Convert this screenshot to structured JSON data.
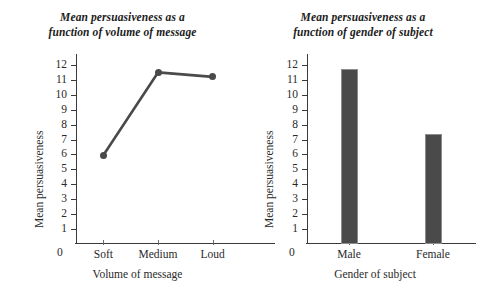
{
  "chart_data": [
    {
      "type": "line",
      "panel": "left",
      "title": "Mean persuasiveness as a function of volume of message",
      "title_lines": [
        "Mean persuasiveness as a",
        "function of volume of message"
      ],
      "xlabel": "Volume of message",
      "ylabel": "Mean persuasiveness",
      "categories": [
        "Soft",
        "Medium",
        "Loud"
      ],
      "values": [
        5.95,
        11.5,
        11.2
      ],
      "ylim": [
        0,
        12.6
      ],
      "yticks": [
        12,
        11,
        10,
        9,
        8,
        7,
        6,
        5,
        4,
        3,
        2,
        1
      ],
      "origin_label": "0",
      "grid": false,
      "legend": "none",
      "series_color": "#4a4a4a",
      "marker": "circle"
    },
    {
      "type": "bar",
      "panel": "right",
      "title": "Mean persuasiveness as a function of gender of subject",
      "title_lines": [
        "Mean persuasiveness as a",
        "function of gender of subject"
      ],
      "xlabel": "Gender of subject",
      "ylabel": "Mean persuasiveness",
      "categories": [
        "Male",
        "Female"
      ],
      "values": [
        11.75,
        7.35
      ],
      "ylim": [
        0,
        12.6
      ],
      "yticks": [
        12,
        11,
        10,
        9,
        8,
        7,
        6,
        5,
        4,
        3,
        2,
        1
      ],
      "origin_label": "0",
      "grid": false,
      "legend": "none",
      "bar_color": "#4a4a4a",
      "bar_edge_color": "#8d8d8d"
    }
  ]
}
